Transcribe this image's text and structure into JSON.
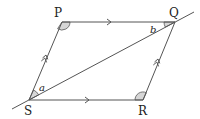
{
  "diagram": {
    "type": "parallelogram-with-diagonal",
    "colors": {
      "line": "#555555",
      "angle_fill": "#d6d6d6",
      "angle_stroke": "#555555",
      "text": "#222222"
    },
    "vertices": {
      "P": {
        "label": "P",
        "x": 62,
        "y": 22
      },
      "Q": {
        "label": "Q",
        "x": 175,
        "y": 22
      },
      "R": {
        "label": "R",
        "x": 143,
        "y": 100
      },
      "S": {
        "label": "S",
        "x": 29,
        "y": 100
      }
    },
    "angle_labels": {
      "a": "a",
      "b": "b"
    },
    "parallel_marks": {
      "PQ": "single",
      "SR": "single",
      "SP": "double",
      "RQ": "double"
    }
  }
}
